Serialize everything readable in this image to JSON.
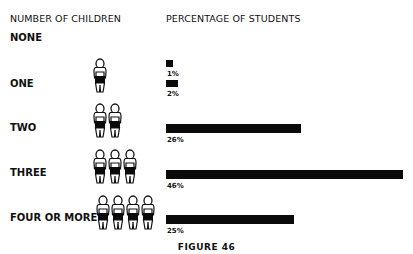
{
  "headers": {
    "left": "NUMBER OF CHILDREN",
    "right": "PERCENTAGE OF STUDENTS"
  },
  "caption": "FIGURE 46",
  "rows": [
    {
      "label": "NONE",
      "children": 0,
      "value_label": "1%"
    },
    {
      "label": "ONE",
      "children": 1,
      "value_label": "2%"
    },
    {
      "label": "TWO",
      "children": 2,
      "value_label": "26%"
    },
    {
      "label": "THREE",
      "children": 3,
      "value_label": "46%"
    },
    {
      "label": "FOUR OR MORE",
      "children": 4,
      "value_label": "25%"
    }
  ],
  "chart_data": {
    "type": "bar",
    "orientation": "horizontal",
    "title": "FIGURE 46",
    "categories": [
      "NONE",
      "ONE",
      "TWO",
      "THREE",
      "FOUR OR MORE"
    ],
    "values": [
      1,
      2,
      26,
      46,
      25
    ],
    "xlabel": "PERCENTAGE OF STUDENTS",
    "ylabel": "NUMBER OF CHILDREN",
    "units": "%",
    "grid": false,
    "legend": null,
    "annotations": [
      "1%",
      "2%",
      "26%",
      "46%",
      "25%"
    ],
    "bar_color": "#0a0a0a"
  }
}
